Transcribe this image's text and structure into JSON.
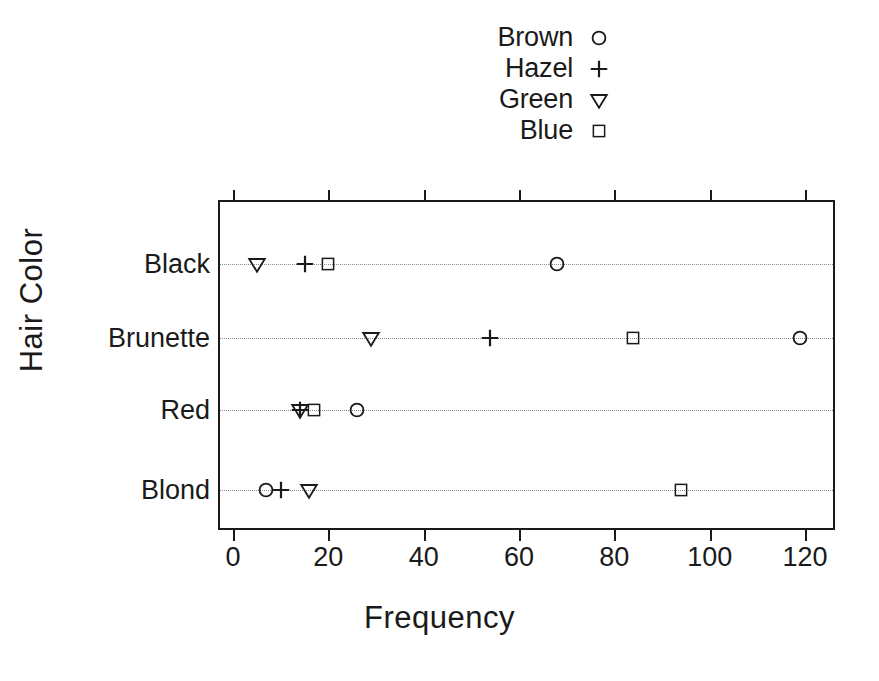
{
  "chart_data": {
    "type": "scatter",
    "title": "",
    "xlabel": "Frequency",
    "ylabel": "Hair Color",
    "categories": [
      "Black",
      "Brunette",
      "Red",
      "Blond"
    ],
    "xlim": [
      0,
      128
    ],
    "xticks": [
      0,
      20,
      40,
      60,
      80,
      100,
      120
    ],
    "xtick_labels": [
      "0",
      "20",
      "40",
      "60",
      "80",
      "100",
      "120"
    ],
    "grid": "dotted-horizontal",
    "legend_position": "top-center",
    "series": [
      {
        "name": "Brown",
        "marker": "circle",
        "glyph": "circle-marker",
        "values": [
          68,
          119,
          26,
          7
        ]
      },
      {
        "name": "Hazel",
        "marker": "plus",
        "glyph": "plus-marker",
        "values": [
          15,
          54,
          14,
          10
        ]
      },
      {
        "name": "Green",
        "marker": "triangle-down",
        "glyph": "triangle-down-marker",
        "values": [
          5,
          29,
          14,
          16
        ]
      },
      {
        "name": "Blue",
        "marker": "square",
        "glyph": "square-marker",
        "values": [
          20,
          84,
          17,
          94
        ]
      }
    ]
  },
  "legend": {
    "entries": [
      {
        "label": "Brown",
        "symbol": "circle"
      },
      {
        "label": "Hazel",
        "symbol": "plus"
      },
      {
        "label": "Green",
        "symbol": "triangle-down"
      },
      {
        "label": "Blue",
        "symbol": "square"
      }
    ]
  },
  "axes": {
    "x_title": "Frequency",
    "y_title": "Hair Color"
  },
  "colors": {
    "foreground": "#1a1a1a",
    "grid": "#8a8a8a",
    "background": "#ffffff"
  }
}
